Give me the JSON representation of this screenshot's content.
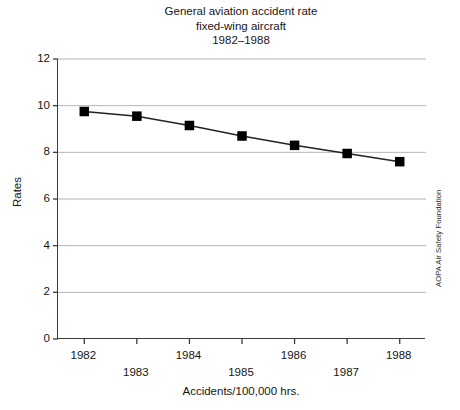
{
  "chart_data": {
    "type": "line",
    "title": "General aviation accident rate fixed-wing aircraft 1982–1988",
    "title_lines": [
      "General aviation accident rate",
      "fixed-wing aircraft",
      "1982–1988"
    ],
    "categories": [
      "1982",
      "1983",
      "1984",
      "1985",
      "1986",
      "1987",
      "1988"
    ],
    "values": [
      9.75,
      9.55,
      9.15,
      8.7,
      8.3,
      7.95,
      7.6
    ],
    "series": [
      {
        "name": "Accident rate",
        "values": [
          9.75,
          9.55,
          9.15,
          8.7,
          8.3,
          7.95,
          7.6
        ]
      }
    ],
    "xlabel": "Accidents/100,000 hrs.",
    "ylabel": "Rates",
    "ylim": [
      0,
      12
    ],
    "yticks": [
      0,
      2,
      4,
      6,
      8,
      10,
      12
    ],
    "ytick_labels": [
      "0",
      "2",
      "4",
      "6",
      "8",
      "10",
      "12"
    ],
    "xtick_labels": [
      "1982",
      "1983",
      "1984",
      "1985",
      "1986",
      "1987",
      "1988"
    ],
    "xtick_rows": [
      0,
      1,
      0,
      1,
      0,
      1,
      0
    ],
    "grid": "horizontal",
    "legend": "none",
    "marker": "square",
    "marker_color": "#000000",
    "line_color": "#222222",
    "grid_color": "#b4b4b4",
    "axis_color": "#3c3c3c",
    "background": "#ffffff",
    "annotations": [
      {
        "name": "credit",
        "text": "AOPA Air Safety Foundation",
        "position": "right-edge-vertical"
      }
    ]
  },
  "credit": {
    "text": "AOPA Air Safety Foundation"
  }
}
